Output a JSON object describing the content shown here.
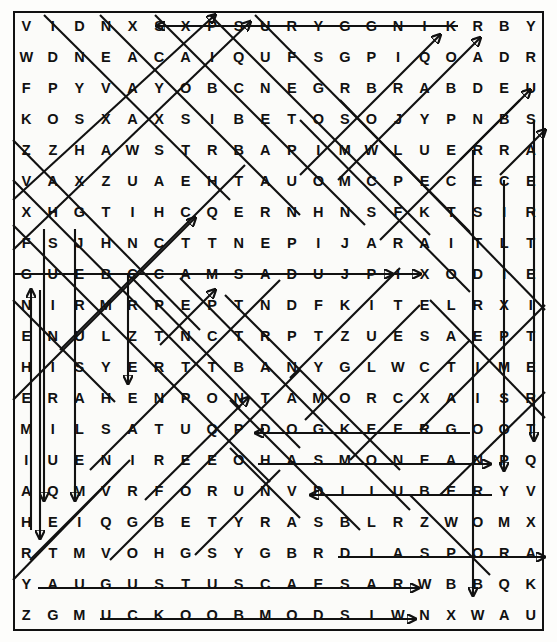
{
  "puzzle": {
    "type": "word-search",
    "rows": 20,
    "cols": 20,
    "border_color": "#111111",
    "letter_color": "#111111",
    "background_color": "#fdfdfb",
    "strike_color": "#111111",
    "grid": [
      [
        "V",
        "I",
        "D",
        "N",
        "X",
        "S",
        "X",
        "P",
        "S",
        "U",
        "R",
        "Y",
        "G",
        "G",
        "N",
        "I",
        "K",
        "R",
        "B",
        "Y"
      ],
      [
        "W",
        "D",
        "N",
        "E",
        "A",
        "C",
        "A",
        "I",
        "Q",
        "U",
        "F",
        "S",
        "G",
        "P",
        "I",
        "Q",
        "O",
        "A",
        "D",
        "R"
      ],
      [
        "F",
        "P",
        "Y",
        "V",
        "A",
        "Y",
        "O",
        "B",
        "C",
        "N",
        "E",
        "G",
        "R",
        "B",
        "R",
        "A",
        "B",
        "D",
        "E",
        "U"
      ],
      [
        "K",
        "O",
        "S",
        "X",
        "A",
        "X",
        "S",
        "I",
        "B",
        "E",
        "T",
        "O",
        "S",
        "O",
        "J",
        "Y",
        "P",
        "N",
        "B",
        "S"
      ],
      [
        "Z",
        "Z",
        "H",
        "A",
        "W",
        "S",
        "T",
        "R",
        "B",
        "A",
        "P",
        "I",
        "M",
        "W",
        "L",
        "U",
        "E",
        "R",
        "R",
        "A"
      ],
      [
        "V",
        "A",
        "X",
        "Z",
        "U",
        "A",
        "E",
        "H",
        "T",
        "A",
        "U",
        "O",
        "M",
        "C",
        "P",
        "E",
        "C",
        "E",
        "C",
        "E"
      ],
      [
        "X",
        "H",
        "G",
        "T",
        "I",
        "H",
        "C",
        "Q",
        "E",
        "R",
        "N",
        "H",
        "N",
        "S",
        "F",
        "K",
        "T",
        "S",
        "I",
        "R"
      ],
      [
        "F",
        "S",
        "J",
        "H",
        "N",
        "C",
        "T",
        "T",
        "N",
        "E",
        "P",
        "I",
        "J",
        "A",
        "R",
        "A",
        "I",
        "T",
        "L",
        "T"
      ],
      [
        "G",
        "U",
        "E",
        "B",
        "C",
        "C",
        "A",
        "M",
        "S",
        "A",
        "D",
        "U",
        "J",
        "P",
        "I",
        "X",
        "O",
        "D",
        "I",
        "E"
      ],
      [
        "N",
        "I",
        "R",
        "M",
        "R",
        "P",
        "E",
        "P",
        "T",
        "N",
        "D",
        "F",
        "K",
        "I",
        "T",
        "E",
        "L",
        "R",
        "X",
        "I"
      ],
      [
        "E",
        "N",
        "U",
        "L",
        "Z",
        "T",
        "N",
        "C",
        "T",
        "R",
        "P",
        "T",
        "Z",
        "U",
        "E",
        "S",
        "A",
        "E",
        "P",
        "T"
      ],
      [
        "H",
        "I",
        "S",
        "Y",
        "E",
        "R",
        "T",
        "T",
        "B",
        "A",
        "N",
        "Y",
        "G",
        "L",
        "W",
        "C",
        "T",
        "I",
        "M",
        "E"
      ],
      [
        "E",
        "R",
        "A",
        "H",
        "E",
        "N",
        "P",
        "O",
        "N",
        "T",
        "A",
        "M",
        "O",
        "R",
        "C",
        "X",
        "A",
        "I",
        "S",
        "R"
      ],
      [
        "M",
        "I",
        "L",
        "S",
        "A",
        "T",
        "U",
        "Q",
        "P",
        "D",
        "O",
        "G",
        "K",
        "E",
        "E",
        "R",
        "G",
        "O",
        "O",
        "T"
      ],
      [
        "I",
        "U",
        "E",
        "N",
        "I",
        "R",
        "E",
        "E",
        "O",
        "H",
        "A",
        "S",
        "M",
        "O",
        "N",
        "E",
        "A",
        "N",
        "P",
        "Q"
      ],
      [
        "A",
        "Q",
        "M",
        "V",
        "R",
        "F",
        "O",
        "R",
        "U",
        "N",
        "V",
        "D",
        "L",
        "I",
        "U",
        "B",
        "E",
        "R",
        "Y",
        "V"
      ],
      [
        "H",
        "E",
        "I",
        "Q",
        "G",
        "B",
        "E",
        "T",
        "Y",
        "R",
        "A",
        "S",
        "B",
        "L",
        "R",
        "Z",
        "W",
        "O",
        "M",
        "X"
      ],
      [
        "R",
        "T",
        "M",
        "V",
        "O",
        "H",
        "G",
        "S",
        "Y",
        "G",
        "B",
        "R",
        "D",
        "I",
        "A",
        "S",
        "P",
        "O",
        "R",
        "A"
      ],
      [
        "Y",
        "A",
        "U",
        "G",
        "U",
        "S",
        "T",
        "U",
        "S",
        "C",
        "A",
        "E",
        "S",
        "A",
        "R",
        "W",
        "B",
        "B",
        "Q",
        "K"
      ],
      [
        "Z",
        "G",
        "M",
        "U",
        "C",
        "K",
        "O",
        "O",
        "B",
        "M",
        "O",
        "D",
        "S",
        "I",
        "W",
        "N",
        "X",
        "W",
        "A",
        "U"
      ]
    ],
    "found_words": [
      {
        "text": "KINGGYRUS",
        "display": "SURYG GNIK",
        "direction": "right-to-left",
        "row": 1
      },
      {
        "text": "MACCABEUS",
        "display": "SUEBACCAM",
        "direction": "right-to-left",
        "row": 9
      },
      {
        "text": "JUDAS",
        "display": "SADUJ",
        "direction": "left-to-right",
        "row": 9
      },
      {
        "text": "GREEK",
        "display": "KEERG",
        "direction": "right-to-left",
        "row": 14
      },
      {
        "text": "HASMONEAN",
        "display": "HASMONEAN",
        "direction": "left-to-right",
        "row": 15
      },
      {
        "text": "REUBEL",
        "display": "DLIUBER",
        "direction": "right-to-left",
        "row": 16
      },
      {
        "text": "DIASPORA",
        "display": "DIASPORA",
        "direction": "left-to-right",
        "row": 18
      },
      {
        "text": "AUGUSTUSCAESAR",
        "display": "AUGUSTUS CAESAR",
        "direction": "left-to-right",
        "row": 19
      },
      {
        "text": "WISDOMBOOKS",
        "display": "SKOOBMODSIW",
        "direction": "right-to-left",
        "row": 20
      }
    ]
  }
}
